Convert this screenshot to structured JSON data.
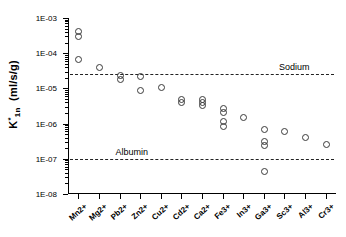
{
  "chart_data": {
    "type": "scatter",
    "title": "",
    "xlabel": "",
    "ylabel": "K*1n  (ml/s/g)",
    "ylabel_base": "K",
    "ylabel_sup": "*",
    "ylabel_sub": "1n",
    "ylabel_units": "(ml/s/g)",
    "yscale": "log",
    "ylim": [
      1e-08,
      0.001
    ],
    "ytick_labels": [
      "1E-03",
      "1E-04",
      "1E-05",
      "1E-06",
      "1E-07",
      "1E-08"
    ],
    "ytick_values": [
      0.001,
      0.0001,
      1e-05,
      1e-06,
      1e-07,
      1e-08
    ],
    "grid": false,
    "legend": "none",
    "categories": [
      "Mn2+",
      "Mg2+",
      "Pb2+",
      "Zn2+",
      "Cu2+",
      "Cd2+",
      "Ca2+",
      "Fe3+",
      "In3+",
      "Ga3+",
      "Sc3+",
      "Al3+",
      "Cr3+"
    ],
    "series": [
      {
        "name": "K*1n",
        "marker": "open-circle",
        "color": "#3a3a3a",
        "points": [
          {
            "category": "Mn2+",
            "values": [
              0.00042,
              0.0003,
              7e-05
            ]
          },
          {
            "category": "Mg2+",
            "values": [
              4e-05
            ]
          },
          {
            "category": "Pb2+",
            "values": [
              2.4e-05,
              1.9e-05
            ]
          },
          {
            "category": "Zn2+",
            "values": [
              2.2e-05,
              9e-06
            ]
          },
          {
            "category": "Cu2+",
            "values": [
              1.1e-05
            ]
          },
          {
            "category": "Cd2+",
            "values": [
              5e-06,
              4e-06
            ]
          },
          {
            "category": "Ca2+",
            "values": [
              5e-06,
              4.2e-06,
              3.4e-06
            ]
          },
          {
            "category": "Fe3+",
            "values": [
              2.8e-06,
              2.2e-06,
              1.2e-06,
              8.5e-07
            ]
          },
          {
            "category": "In3+",
            "values": [
              1.5e-06
            ]
          },
          {
            "category": "Ga3+",
            "values": [
              7e-07,
              3.2e-07,
              2.4e-07,
              4.5e-08
            ]
          },
          {
            "category": "Sc3+",
            "values": [
              6e-07
            ]
          },
          {
            "category": "Al3+",
            "values": [
              4.2e-07
            ]
          },
          {
            "category": "Cr3+",
            "values": [
              2.6e-07
            ]
          }
        ]
      }
    ],
    "reference_lines": [
      {
        "label": "Sodium",
        "value": 2.5e-05,
        "style": "dashed",
        "label_x_pct": 78
      },
      {
        "label": "Albumin",
        "value": 1e-07,
        "style": "dashed",
        "label_x_pct": 17
      }
    ]
  }
}
